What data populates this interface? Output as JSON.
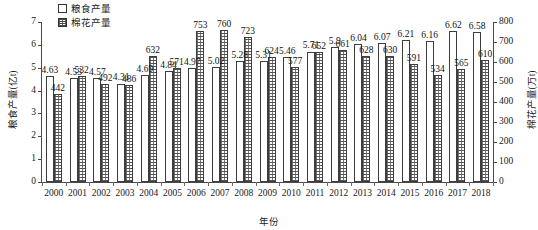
{
  "chart_data": {
    "type": "bar",
    "title": "",
    "xlabel": "年份",
    "ylabel": "粮食产量(亿t)",
    "y2label": "棉花产量(万t)",
    "grid": false,
    "legend_position": "top-left",
    "categories": [
      "2000",
      "2001",
      "2002",
      "2003",
      "2004",
      "2005",
      "2006",
      "2007",
      "2008",
      "2009",
      "2010",
      "2011",
      "2012",
      "2013",
      "2014",
      "2015",
      "2016",
      "2017",
      "2018"
    ],
    "ylim": [
      0,
      7
    ],
    "yticks": [
      "0",
      "1",
      "2",
      "3",
      "4",
      "5",
      "6",
      "7"
    ],
    "y2lim": [
      0,
      800
    ],
    "y2ticks": [
      "0",
      "100",
      "200",
      "300",
      "400",
      "500",
      "600",
      "700",
      "800"
    ],
    "series": [
      {
        "name": "粮食产量",
        "axis": "left",
        "unit": "亿t",
        "fill": "white",
        "values": [
          4.63,
          4.53,
          4.57,
          4.31,
          4.69,
          4.84,
          4.97,
          5.02,
          5.28,
          5.31,
          5.46,
          5.71,
          5.9,
          6.04,
          6.07,
          6.21,
          6.16,
          6.62,
          6.58
        ],
        "labels": [
          "4.63",
          "4.53",
          "4.57",
          "4.31",
          "4.69",
          "4.84",
          "4.97",
          "5.02",
          "5.28",
          "5.31",
          "5.46",
          "5.71",
          "5.9",
          "6.04",
          "6.07",
          "6.21",
          "6.16",
          "6.62",
          "6.58"
        ]
      },
      {
        "name": "棉花产量",
        "axis": "right",
        "unit": "万t",
        "fill": "hatched",
        "values": [
          442,
          532,
          492,
          486,
          632,
          571,
          753,
          760,
          723,
          624,
          577,
          652,
          661,
          628,
          630,
          591,
          534,
          565,
          610
        ],
        "labels": [
          "442",
          "532",
          "492",
          "486",
          "632",
          "571",
          "753",
          "760",
          "723",
          "624",
          "577",
          "652",
          "661",
          "628",
          "630",
          "591",
          "534",
          "565",
          "610"
        ]
      }
    ]
  },
  "legend": {
    "items": [
      {
        "label": "粮食产量",
        "swatch": "empty-box"
      },
      {
        "label": "棉花产量",
        "swatch": "hatched-box"
      }
    ]
  },
  "axes": {
    "left_title": "粮食产量(亿t)",
    "right_title": "棉花产量(万t)",
    "bottom_title": "年份"
  },
  "colors": {
    "axis": "#4a4a4a",
    "bar_outline": "#3d3d3d",
    "grain_fill": "#ffffff",
    "cotton_fill": "#ffffff",
    "text": "#1a1a1a"
  }
}
